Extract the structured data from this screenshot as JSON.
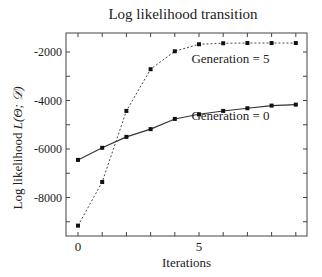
{
  "chart_data": {
    "type": "line",
    "title": "Log likelihood transition",
    "xlabel": "Iterations",
    "ylabel_text": "Log likelihood ",
    "ylabel_math": "L(Θ; 𝒟)",
    "x": [
      0,
      1,
      2,
      3,
      4,
      5,
      6,
      7,
      8,
      9
    ],
    "xlim": [
      -0.5,
      9.5
    ],
    "ylim": [
      -9600,
      -1250
    ],
    "xticks": [
      0,
      5
    ],
    "xtick_labels": [
      "0",
      "5"
    ],
    "yticks": [
      -8000,
      -6000,
      -4000,
      -2000
    ],
    "ytick_labels": [
      "-8000",
      "-6000",
      "-4000",
      "-2000"
    ],
    "grid": false,
    "legend": "inline annotations",
    "series": [
      {
        "name": "Generation = 0",
        "style": "solid",
        "values": [
          -6450,
          -5950,
          -5500,
          -5180,
          -4760,
          -4570,
          -4430,
          -4320,
          -4210,
          -4170
        ],
        "annotation": {
          "text": "Generation = 0",
          "x": 6.3,
          "y": -4800
        }
      },
      {
        "name": "Generation = 5",
        "style": "dotted",
        "values": [
          -9160,
          -7360,
          -4430,
          -2710,
          -1970,
          -1680,
          -1640,
          -1630,
          -1630,
          -1630
        ],
        "annotation": {
          "text": "Generation = 5",
          "x": 6.3,
          "y": -2450
        }
      }
    ]
  }
}
